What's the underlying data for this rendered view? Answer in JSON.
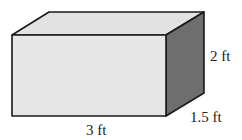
{
  "diagram": {
    "shape": "rectangular prism",
    "colors": {
      "front_face": "#e6e6e6",
      "top_face": "#e2e2e2",
      "side_face": "#6e6e6e",
      "edge": "#1a1a1a"
    },
    "labels": {
      "height": "2 ft",
      "depth": "1.5 ft",
      "length": "3 ft"
    }
  }
}
